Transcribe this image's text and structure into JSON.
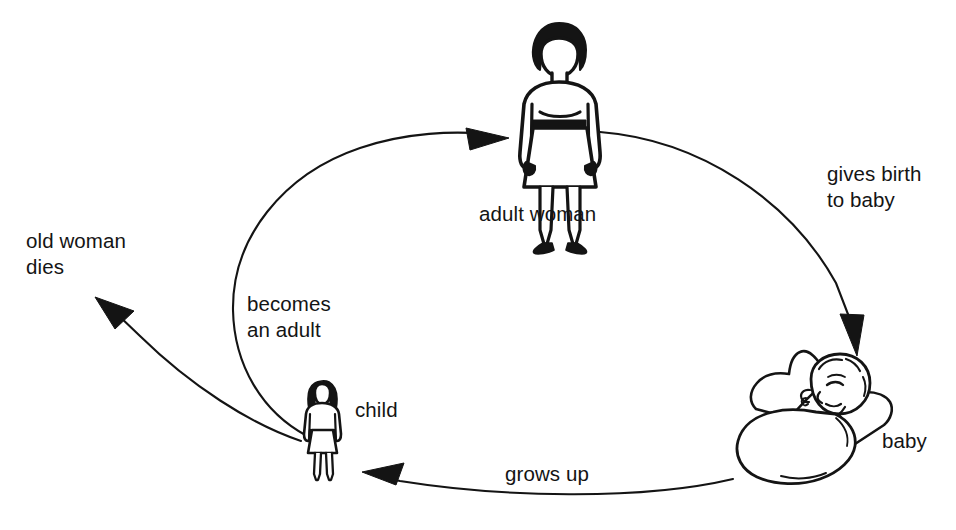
{
  "diagram": {
    "type": "cycle-diagram",
    "background_color": "#ffffff",
    "ink_color": "#141414",
    "labels": {
      "old_woman_dies_line1": "old woman",
      "old_woman_dies_line2": "dies",
      "becomes_adult_line1": "becomes",
      "becomes_adult_line2": "an adult",
      "adult_woman": "adult woman",
      "gives_birth_line1": "gives birth",
      "gives_birth_line2": "to baby",
      "child": "child",
      "baby": "baby",
      "grows_up": "grows up"
    },
    "nodes": [
      {
        "name": "adult-woman-figure",
        "label": "adult woman",
        "x": 560,
        "y": 100
      },
      {
        "name": "baby-figure",
        "label": "baby",
        "x": 820,
        "y": 420
      },
      {
        "name": "child-figure",
        "label": "child",
        "x": 322,
        "y": 425
      }
    ],
    "transitions": [
      {
        "name": "gives-birth-to-baby",
        "label": "gives birth to baby",
        "from": "adult woman",
        "to": "baby"
      },
      {
        "name": "grows-up",
        "label": "grows up",
        "from": "baby",
        "to": "child"
      },
      {
        "name": "becomes-an-adult",
        "label": "becomes an adult",
        "from": "child",
        "to": "adult woman"
      },
      {
        "name": "old-woman-dies",
        "label": "old woman dies",
        "from": "adult woman",
        "to": "death"
      }
    ]
  }
}
